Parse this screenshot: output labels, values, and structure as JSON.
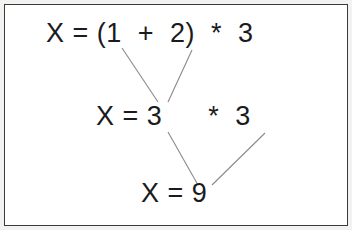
{
  "document": {
    "title": "Expression evaluation trace",
    "background_color": "#ffffff",
    "frame_color": "#3a3a3c",
    "scan_edge_color": "#f2f2f0",
    "text_color": "#1b1b1d",
    "connector_color": "#8a8a8c"
  },
  "expression": {
    "original": "X = (1 + 2) * 3",
    "result": "X = 9",
    "variable": "X",
    "operands": [
      1,
      2,
      3
    ],
    "operators": [
      "+",
      "*"
    ],
    "final_value": 9
  },
  "steps": [
    {
      "index": 1,
      "line_id": "line-1",
      "text": "X = (1  +  2)  *  3",
      "segments": [
        "X = (1",
        "+",
        "2)",
        "*",
        "3"
      ],
      "description": "original expression with parentheses"
    },
    {
      "index": 2,
      "line_id": "line-2",
      "text": "X = 3",
      "tail_text": "*  3",
      "description": "parenthesized sum reduced to 3"
    },
    {
      "index": 3,
      "line_id": "line-3",
      "text": "X = 9",
      "description": "final product result"
    }
  ],
  "connectors": [
    {
      "id": "connector-1-to-sum",
      "from": "operand-1",
      "to": "step-2-sum",
      "x1": 122,
      "y1": 48,
      "x2": 158,
      "y2": 102
    },
    {
      "id": "connector-2-to-sum",
      "from": "operand-2",
      "to": "step-2-sum",
      "x1": 192,
      "y1": 50,
      "x2": 168,
      "y2": 102
    },
    {
      "id": "connector-sum-to-result",
      "from": "step-2-sum",
      "to": "step-3-result",
      "x1": 168,
      "y1": 132,
      "x2": 198,
      "y2": 185
    },
    {
      "id": "connector-mult-to-result",
      "from": "step-2-multiplier",
      "to": "step-3-result",
      "x1": 265,
      "y1": 133,
      "x2": 212,
      "y2": 185
    }
  ]
}
